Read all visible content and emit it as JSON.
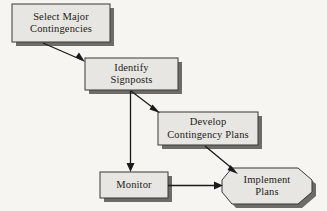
{
  "diagram": {
    "background_color": "#f6f5f1",
    "shape_fill": "#e7e6e2",
    "shape_border": "#3a3835",
    "shape_shadow": "#6e6c68",
    "arrow_color": "#1d1b19",
    "nodes": [
      {
        "id": "select-major-contingencies",
        "shape": "rectangle",
        "line1": "Select Major",
        "line2": "Contingencies",
        "x": 12,
        "y": 4,
        "w": 98,
        "h": 38
      },
      {
        "id": "identify-signposts",
        "shape": "rectangle",
        "line1": "Identify",
        "line2": "Signposts",
        "x": 85,
        "y": 58,
        "w": 93,
        "h": 32
      },
      {
        "id": "develop-contingency-plans",
        "shape": "rectangle",
        "line1": "Develop",
        "line2": "Contingency Plans",
        "x": 158,
        "y": 112,
        "w": 100,
        "h": 33
      },
      {
        "id": "monitor",
        "shape": "rectangle",
        "line1": "Monitor",
        "line2": "",
        "x": 100,
        "y": 172,
        "w": 68,
        "h": 26
      },
      {
        "id": "implement-plans",
        "shape": "octagon",
        "line1": "Implement",
        "line2": "Plans",
        "x": 222,
        "y": 168,
        "w": 90,
        "h": 36
      }
    ],
    "arrows": [
      {
        "id": "select-to-identify",
        "from": "select-major-contingencies",
        "to": "identify-signposts"
      },
      {
        "id": "identify-to-develop",
        "from": "identify-signposts",
        "to": "develop-contingency-plans"
      },
      {
        "id": "identify-to-monitor",
        "from": "identify-signposts",
        "to": "monitor"
      },
      {
        "id": "develop-to-implement",
        "from": "develop-contingency-plans",
        "to": "implement-plans"
      },
      {
        "id": "monitor-to-implement",
        "from": "monitor",
        "to": "implement-plans"
      }
    ]
  }
}
